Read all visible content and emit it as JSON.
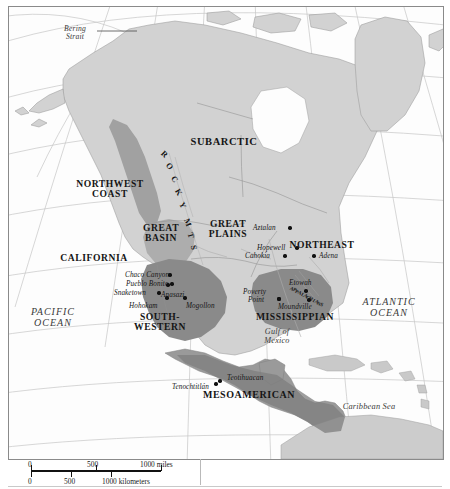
{
  "map": {
    "title": "Culture Areas and Archaeological Sites of North America",
    "culture_areas": [
      {
        "name": "SUBARCTIC",
        "x": 215,
        "y": 135,
        "size": 10.5,
        "lines": [
          "SUBARCTIC"
        ]
      },
      {
        "name": "NORTHWEST COAST",
        "x": 101,
        "y": 182,
        "size": 9.6,
        "lines": [
          "NORTHWEST",
          "COAST"
        ]
      },
      {
        "name": "GREAT BASIN",
        "x": 152,
        "y": 226,
        "size": 9.6,
        "lines": [
          "GREAT",
          "BASIN"
        ]
      },
      {
        "name": "CALIFORNIA",
        "x": 85,
        "y": 251,
        "size": 9.6,
        "lines": [
          "CALIFORNIA"
        ]
      },
      {
        "name": "GREAT PLAINS",
        "x": 219,
        "y": 222,
        "size": 9.6,
        "lines": [
          "GREAT",
          "PLAINS"
        ]
      },
      {
        "name": "NORTHEAST",
        "x": 313,
        "y": 238,
        "size": 9.6,
        "lines": [
          "NORTHEAST"
        ]
      },
      {
        "name": "SOUTH-WESTERN",
        "x": 151,
        "y": 315,
        "size": 9.6,
        "lines": [
          "SOUTH-",
          "WESTERN"
        ]
      },
      {
        "name": "MISSISSIPPIAN",
        "x": 286,
        "y": 310,
        "size": 9.6,
        "lines": [
          "MISSISSIPPIAN"
        ]
      },
      {
        "name": "MESOAMERICAN",
        "x": 240,
        "y": 388,
        "size": 10.0,
        "lines": [
          "MESOAMERICAN"
        ]
      }
    ],
    "sites": [
      {
        "name": "Aztalan",
        "lx": 244,
        "ly": 218,
        "dx": 281,
        "dy": 221,
        "align": "left"
      },
      {
        "name": "Hopewell",
        "lx": 248,
        "ly": 238,
        "dx": 288,
        "dy": 241,
        "align": "left"
      },
      {
        "name": "Cahokia",
        "lx": 236,
        "ly": 246,
        "dx": 276,
        "dy": 249,
        "align": "left"
      },
      {
        "name": "Adena",
        "lx": 310,
        "ly": 246,
        "dx": 305,
        "dy": 249,
        "align": "left"
      },
      {
        "name": "Chaco Canyon",
        "lx": 116,
        "ly": 265,
        "dx": 161,
        "dy": 268,
        "align": "left"
      },
      {
        "name": "Pueblo Bonito",
        "lx": 117,
        "ly": 274,
        "dx": 163,
        "dy": 277,
        "align": "left"
      },
      {
        "name": "Snaketown",
        "lx": 105,
        "ly": 283,
        "dx": 150,
        "dy": 286,
        "align": "left"
      },
      {
        "name": "Anasazi",
        "lx": 152,
        "ly": 285,
        "dx": 159,
        "dy": 278,
        "align": "left"
      },
      {
        "name": "Hohokam",
        "lx": 120,
        "ly": 296,
        "dx": 158,
        "dy": 291,
        "align": "left"
      },
      {
        "name": "Mogollon",
        "lx": 177,
        "ly": 296,
        "dx": 176,
        "dy": 291,
        "align": "left"
      },
      {
        "name": "Poverty",
        "lx": 234,
        "ly": 282,
        "dx": 270,
        "dy": 292,
        "align": "left"
      },
      {
        "name": "Point",
        "lx": 239,
        "ly": 290,
        "dx": 270,
        "dy": 292,
        "align": "left"
      },
      {
        "name": "Etowah",
        "lx": 280,
        "ly": 273,
        "dx": 297,
        "dy": 284,
        "align": "left"
      },
      {
        "name": "Moundville",
        "lx": 269,
        "ly": 297,
        "dx": 300,
        "dy": 293,
        "align": "left"
      },
      {
        "name": "Tenochtitlán",
        "lx": 163,
        "ly": 377,
        "dx": 207,
        "dy": 377,
        "align": "left"
      },
      {
        "name": "Teotihuacan",
        "lx": 218,
        "ly": 368,
        "dx": 211,
        "dy": 374,
        "align": "left"
      }
    ],
    "water_labels": [
      {
        "name": "PACIFIC OCEAN",
        "x": 44,
        "y": 310,
        "size": 10.0,
        "lines": [
          "PACIFIC",
          "OCEAN"
        ],
        "spacing": 1.0
      },
      {
        "name": "ATLANTIC OCEAN",
        "x": 380,
        "y": 300,
        "size": 10.0,
        "lines": [
          "ATLANTIC",
          "OCEAN"
        ],
        "spacing": 1.0
      },
      {
        "name": "Gulf of Mexico",
        "x": 268,
        "y": 330,
        "size": 8.2,
        "lines": [
          "Gulf of",
          "Mexico"
        ],
        "spacing": 0.2
      },
      {
        "name": "Caribbean Sea",
        "x": 360,
        "y": 400,
        "size": 8.4,
        "lines": [
          "Caribbean Sea"
        ],
        "spacing": 0.2
      },
      {
        "name": "Bering Strait",
        "x": 66,
        "y": 26,
        "size": 7.6,
        "lines": [
          "Bering",
          "Strait"
        ],
        "spacing": 0.2
      }
    ],
    "range_labels": [
      {
        "name": "ROCKY MTS",
        "letters": [
          "R",
          "O",
          "C",
          "K",
          "Y",
          "M",
          "T",
          "S"
        ]
      },
      {
        "name": "APPALACHIANS",
        "letters": [
          "A",
          "P",
          "P",
          "A",
          "L",
          "A",
          "C",
          "H",
          "I",
          "A",
          "N",
          "S"
        ]
      }
    ],
    "scale": {
      "miles_values": [
        "0",
        "500",
        "1000 miles"
      ],
      "km_values": [
        "0",
        "500",
        "1000 kilometers"
      ]
    },
    "colors": {
      "land_light": "#d3d3d3",
      "land_mid": "#bdbdbd",
      "region_dark": "#8d8d8d",
      "region_darker": "#7b7b7b",
      "ocean": "#fdfdfd",
      "graticule": "#c3c3c3",
      "coastline": "#9a9a9a",
      "text": "#151515"
    }
  }
}
